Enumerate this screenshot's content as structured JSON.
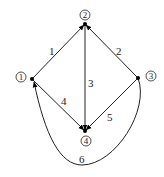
{
  "diagram": {
    "type": "directed-graph",
    "nodes": [
      {
        "id": "1",
        "label": "1"
      },
      {
        "id": "2",
        "label": "2"
      },
      {
        "id": "3",
        "label": "3"
      },
      {
        "id": "4",
        "label": "4"
      }
    ],
    "edges": [
      {
        "id": "e1",
        "label": "1",
        "from": "1",
        "to": "2"
      },
      {
        "id": "e2",
        "label": "2",
        "from": "3",
        "to": "2"
      },
      {
        "id": "e3",
        "label": "3",
        "from": "2",
        "to": "4"
      },
      {
        "id": "e4",
        "label": "4",
        "from": "1",
        "to": "4"
      },
      {
        "id": "e5",
        "label": "5",
        "from": "3",
        "to": "4"
      },
      {
        "id": "e6",
        "label": "6",
        "from": "3",
        "to": "1"
      }
    ]
  }
}
